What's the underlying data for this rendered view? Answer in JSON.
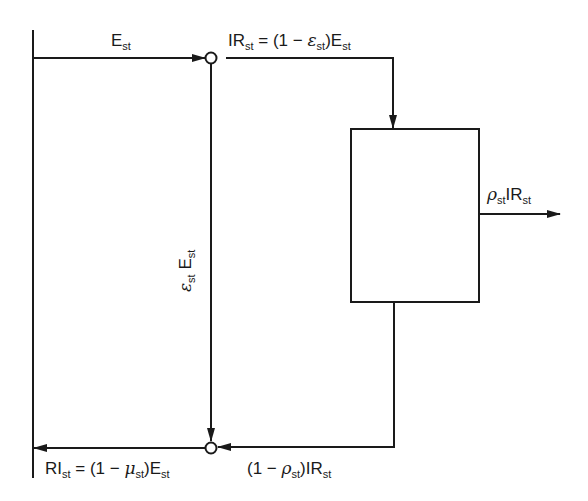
{
  "diagram": {
    "type": "flow-diagram",
    "stroke_color": "#1a1a1a",
    "background": "#ffffff",
    "labels": {
      "input_flow": {
        "base": "E",
        "sub": "st"
      },
      "irrigation_return": {
        "lhs_base": "IR",
        "lhs_sub": "st",
        "eq": "= (1 − ",
        "greek": "ε",
        "greek_sub": "st",
        "close": ")E",
        "close_sub": "st"
      },
      "diverted": {
        "greek": "ε",
        "greek_sub": "st",
        "base": "E",
        "sub": "st"
      },
      "output": {
        "greek": "ρ",
        "greek_sub": "st",
        "base": "IR",
        "sub": "st"
      },
      "return_loop": {
        "open": "(1 − ",
        "greek": "ρ",
        "greek_sub": "st",
        "close": ")IR",
        "close_sub": "st"
      },
      "return_inflow": {
        "lhs_base": "RI",
        "lhs_sub": "st",
        "eq": "= (1 − ",
        "greek": "μ",
        "greek_sub": "st",
        "close": ")E",
        "close_sub": "st"
      }
    },
    "nodes": [
      {
        "id": "top-junction",
        "shape": "circle"
      },
      {
        "id": "bottom-junction",
        "shape": "circle"
      },
      {
        "id": "process-box",
        "shape": "rectangle"
      }
    ]
  }
}
